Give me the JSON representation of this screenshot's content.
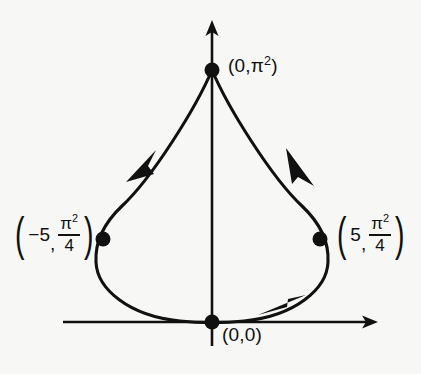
{
  "figure": {
    "background_color": "#f7f7f6",
    "ink_color": "#111111",
    "axes": {
      "x_axis": {
        "label": "",
        "from_x": 63,
        "to_x": 378,
        "y": 322,
        "arrow": "right"
      },
      "y_axis": {
        "label": "",
        "x": 212,
        "from_y": 344,
        "to_y": 20,
        "arrow": "up"
      },
      "origin": {
        "x": 212,
        "y": 322
      }
    },
    "curve": {
      "type": "closed-loop-with-cusp",
      "direction": "clockwise",
      "stroke_width": 3,
      "cusp_at": "top"
    },
    "points": [
      {
        "name": "top-cusp-point",
        "label_text": "(0,π²)",
        "x": 212,
        "y": 70,
        "radius": 7
      },
      {
        "name": "left-point",
        "label_text": "(−5, π²/4)",
        "x": 103,
        "y": 239,
        "radius": 7
      },
      {
        "name": "right-point",
        "label_text": "(5, π²/4)",
        "x": 320,
        "y": 239,
        "radius": 7
      },
      {
        "name": "origin-point",
        "label_text": "(0,0)",
        "x": 212,
        "y": 322,
        "radius": 7
      }
    ],
    "labels": {
      "top": {
        "open": "(",
        "x_value": "0",
        "comma": ",",
        "y_symbol": "π",
        "y_exponent": "2",
        "close": ")"
      },
      "left": {
        "open": "(",
        "x_value": "−5",
        "comma": ",",
        "num_symbol": "π",
        "num_exponent": "2",
        "den": "4",
        "close": ")"
      },
      "right": {
        "open": "(",
        "x_value": "5",
        "comma": ",",
        "num_symbol": "π",
        "num_exponent": "2",
        "den": "4",
        "close": ")"
      },
      "origin": {
        "text": "(0,0)"
      }
    },
    "arrows_on_curve": [
      {
        "name": "arrow-upper-left",
        "direction": "down-left",
        "x": 142,
        "y": 160
      },
      {
        "name": "arrow-upper-right",
        "direction": "up-left",
        "x": 298,
        "y": 165
      },
      {
        "name": "arrow-lower-right",
        "direction": "down-left",
        "x": 280,
        "y": 305
      }
    ]
  }
}
